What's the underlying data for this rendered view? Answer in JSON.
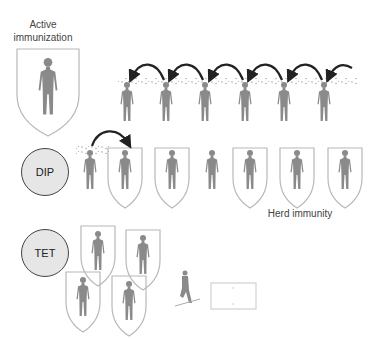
{
  "labels": {
    "active_immunization": "Active immunization",
    "herd_immunity": "Herd immunity"
  },
  "vaccines": [
    {
      "name": "DIP"
    },
    {
      "name": "TET"
    }
  ],
  "colors": {
    "figure": "#8a8a8a",
    "shield_outline": "#b8b8b8",
    "arrow": "#222222",
    "circle_fill": "#e6e6e6",
    "circle_stroke": "#444444"
  },
  "rows": {
    "top_transmission_chain": {
      "figures": 7,
      "arrows": 6,
      "shielded": 0
    },
    "dip_row": {
      "figures": 7,
      "shielded_indices": [
        1,
        2,
        4,
        5,
        6
      ],
      "arrows": 1
    },
    "tet_cluster": {
      "figures": 4,
      "shielded": 4
    }
  },
  "misc_icons": [
    "injured-person-icon",
    "blank-card-icon"
  ]
}
